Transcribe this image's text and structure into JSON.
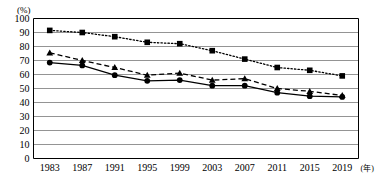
{
  "chart_data": {
    "type": "line",
    "title": "",
    "xlabel": "年",
    "ylabel": "(%)",
    "ylim": [
      0,
      100
    ],
    "ytick_step": 10,
    "grid": true,
    "legend_position": "none",
    "categories": [
      "1983",
      "1987",
      "1991",
      "1995",
      "1999",
      "2003",
      "2007",
      "2011",
      "2015",
      "2019"
    ],
    "yticks": [
      "0",
      "10",
      "20",
      "30",
      "40",
      "50",
      "60",
      "70",
      "80",
      "90",
      "100"
    ],
    "series": [
      {
        "name": "series-squares-dotted",
        "marker": "square",
        "line_style": "dotted",
        "color": "#000000",
        "values": [
          91.5,
          90,
          87,
          83,
          82,
          77,
          71,
          65,
          63,
          59
        ]
      },
      {
        "name": "series-triangles-dashed",
        "marker": "triangle",
        "line_style": "dashed",
        "color": "#000000",
        "values": [
          75.5,
          70,
          65,
          59.5,
          61,
          56,
          57,
          50,
          48,
          45
        ]
      },
      {
        "name": "series-circles-solid",
        "marker": "circle",
        "line_style": "solid",
        "color": "#000000",
        "values": [
          68.5,
          66.5,
          59.5,
          55.5,
          56,
          52,
          52,
          47,
          44.5,
          44
        ]
      }
    ]
  },
  "axis": {
    "y_unit_label": "(%)",
    "x_unit_label": "(年)"
  }
}
